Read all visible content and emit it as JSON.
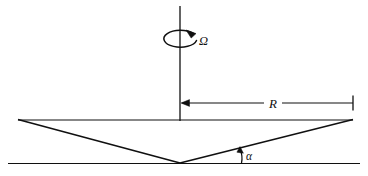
{
  "figure": {
    "domain_type": "diagram",
    "background_color": "#ffffff",
    "line_color": "#101010",
    "labels": {
      "angular_velocity": "Ω",
      "radius": "R",
      "angle": "α"
    },
    "elements": {
      "rotation_axis": "vertical-axis-line",
      "rotation_arrow": "circular-arrow-around-axis",
      "radius_dimension": "horizontal-dimension-line-with-left-arrow-and-right-tick",
      "cone_top_edge": "horizontal-rim-line",
      "cone_left_slant": "left-slanted-cone-wall",
      "cone_right_slant": "right-slanted-cone-wall",
      "base_line": "horizontal-ground-line",
      "angle_marker": "angle-arc-at-base-right"
    },
    "geometry": {
      "axis_x": 180,
      "axis_top_y": 6,
      "axis_bottom_y": 121,
      "rim_y": 120,
      "rim_left_x": 18,
      "rim_right_x": 353,
      "apex_x": 180,
      "apex_y": 163,
      "base_y": 163,
      "base_left_x": 8,
      "base_right_x": 360,
      "dim_line_y": 103,
      "dim_left_x": 181,
      "dim_right_x": 353,
      "radius_label_x": 272,
      "radius_label_y": 107,
      "omega_label_x": 199,
      "omega_label_y": 45,
      "alpha_label_x": 246,
      "alpha_label_y": 160
    }
  }
}
